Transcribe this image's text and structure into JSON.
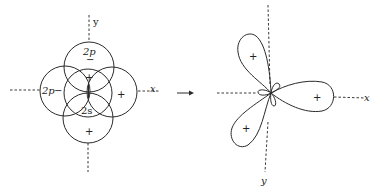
{
  "left_figure": {
    "axis_labels": {
      "y": "y",
      "x": "x"
    },
    "circles": [
      {
        "id": "top",
        "label": "2p",
        "sign": "−"
      },
      {
        "id": "left",
        "label": "2p",
        "sign": "−"
      },
      {
        "id": "center",
        "label": "2s",
        "sign": "+"
      },
      {
        "id": "right",
        "label": "",
        "sign": "+"
      },
      {
        "id": "bottom",
        "label": "",
        "sign": "+"
      }
    ]
  },
  "arrow": {
    "direction": "right"
  },
  "right_figure": {
    "axis_labels": {
      "x": "x",
      "y": "y"
    },
    "lobes": [
      {
        "id": "upper-left",
        "sign": "+"
      },
      {
        "id": "right",
        "sign": "+"
      },
      {
        "id": "lower-left",
        "sign": "+"
      }
    ]
  }
}
